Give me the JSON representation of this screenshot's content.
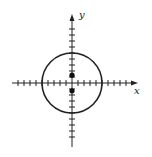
{
  "figure": {
    "type": "coordinate-plane",
    "x_axis_label": "x",
    "y_axis_label": "y",
    "origin_px": [
      72,
      83
    ],
    "unit_px": 6,
    "x_ticks_range": [
      -9,
      9
    ],
    "y_ticks_range": [
      -9,
      9
    ],
    "circle": {
      "center": [
        0,
        0
      ],
      "radius": 5
    },
    "points": [
      {
        "x": 0,
        "y": 1.3
      },
      {
        "x": 0,
        "y": -1.3
      }
    ],
    "stroke_color": "#222222"
  }
}
